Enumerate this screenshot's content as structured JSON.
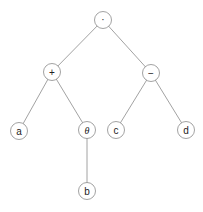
{
  "diagram": {
    "type": "expression-tree",
    "nodes": [
      {
        "id": "root",
        "label": "·",
        "x": 103,
        "y": 20
      },
      {
        "id": "plus",
        "label": "+",
        "x": 52,
        "y": 72
      },
      {
        "id": "minus",
        "label": "−",
        "x": 151,
        "y": 73
      },
      {
        "id": "a",
        "label": "a",
        "x": 19,
        "y": 131
      },
      {
        "id": "theta",
        "label": "θ",
        "x": 87,
        "y": 130
      },
      {
        "id": "c",
        "label": "c",
        "x": 116,
        "y": 130
      },
      {
        "id": "d",
        "label": "d",
        "x": 186,
        "y": 130
      },
      {
        "id": "b",
        "label": "b",
        "x": 87,
        "y": 191
      }
    ],
    "edges": [
      [
        "root",
        "plus"
      ],
      [
        "root",
        "minus"
      ],
      [
        "plus",
        "a"
      ],
      [
        "plus",
        "theta"
      ],
      [
        "minus",
        "c"
      ],
      [
        "minus",
        "d"
      ],
      [
        "theta",
        "b"
      ]
    ]
  }
}
